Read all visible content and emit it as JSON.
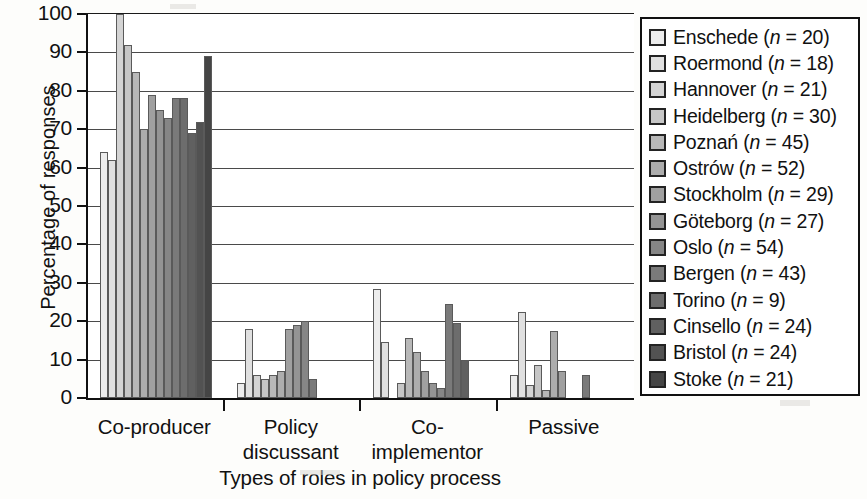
{
  "axis": {
    "ylabel": "Percentage of responses",
    "xlabel": "Types of roles in policy process",
    "yticks": [
      "0",
      "10",
      "20",
      "30",
      "40",
      "50",
      "60",
      "70",
      "80",
      "90",
      "100"
    ]
  },
  "legend": {
    "title": "",
    "items": [
      {
        "label": "Enschede (",
        "n_prefix": "n",
        "n_value": " = 20)",
        "color": "#ececec"
      },
      {
        "label": "Roermond (",
        "n_prefix": "n",
        "n_value": " = 18)",
        "color": "#e0e0e0"
      },
      {
        "label": "Hannover (",
        "n_prefix": "n",
        "n_value": " = 21)",
        "color": "#d4d4d4"
      },
      {
        "label": "Heidelberg (",
        "n_prefix": "n",
        "n_value": " = 30)",
        "color": "#c6c6c6"
      },
      {
        "label": "Poznań (",
        "n_prefix": "n",
        "n_value": " = 45)",
        "color": "#b8b8b8"
      },
      {
        "label": "Ostrów (",
        "n_prefix": "n",
        "n_value": " = 52)",
        "color": "#adadad"
      },
      {
        "label": "Stockholm (",
        "n_prefix": "n",
        "n_value": " = 29)",
        "color": "#a0a0a0"
      },
      {
        "label": "Göteborg (",
        "n_prefix": "n",
        "n_value": " = 27)",
        "color": "#949494"
      },
      {
        "label": "Oslo (",
        "n_prefix": "n",
        "n_value": " = 54)",
        "color": "#868686"
      },
      {
        "label": "Bergen (",
        "n_prefix": "n",
        "n_value": " = 43)",
        "color": "#7a7a7a"
      },
      {
        "label": "Torino (",
        "n_prefix": "n",
        "n_value": " = 9)",
        "color": "#6d6d6d"
      },
      {
        "label": "Cinsello (",
        "n_prefix": "n",
        "n_value": " = 24)",
        "color": "#606060"
      },
      {
        "label": "Bristol (",
        "n_prefix": "n",
        "n_value": " = 24)",
        "color": "#525252"
      },
      {
        "label": "Stoke (",
        "n_prefix": "n",
        "n_value": " = 21)",
        "color": "#454545"
      }
    ]
  },
  "chart_data": {
    "type": "bar",
    "title": "",
    "xlabel": "Types of roles in policy process",
    "ylabel": "Percentage of responses",
    "ylim": [
      0,
      100
    ],
    "ytick_step": 10,
    "grid": true,
    "legend_position": "right",
    "categories": [
      "Co-producer",
      "Policy discussant",
      "Co-implementor",
      "Passive"
    ],
    "category_lines": [
      [
        "Co-producer"
      ],
      [
        "Policy",
        "discussant"
      ],
      [
        "Co-implementor"
      ],
      [
        "Passive"
      ]
    ],
    "series": [
      {
        "name": "Enschede",
        "n": 20,
        "color": "#ececec",
        "values": [
          64,
          4,
          28.5,
          6
        ]
      },
      {
        "name": "Roermond",
        "n": 18,
        "color": "#e0e0e0",
        "values": [
          62,
          18,
          14.5,
          22.5
        ]
      },
      {
        "name": "Hannover",
        "n": 21,
        "color": "#d4d4d4",
        "values": [
          100,
          6,
          0,
          3.5
        ]
      },
      {
        "name": "Heidelberg",
        "n": 30,
        "color": "#c6c6c6",
        "values": [
          92,
          5,
          4,
          8.5
        ]
      },
      {
        "name": "Poznań",
        "n": 45,
        "color": "#b8b8b8",
        "values": [
          85,
          6,
          15.5,
          2
        ]
      },
      {
        "name": "Ostrów",
        "n": 52,
        "color": "#adadad",
        "values": [
          70,
          7,
          12,
          17.5
        ]
      },
      {
        "name": "Stockholm",
        "n": 29,
        "color": "#a0a0a0",
        "values": [
          79,
          18,
          7,
          7
        ]
      },
      {
        "name": "Göteborg",
        "n": 27,
        "color": "#949494",
        "values": [
          75,
          19,
          4,
          0
        ]
      },
      {
        "name": "Oslo",
        "n": 54,
        "color": "#868686",
        "values": [
          73,
          20,
          2.5,
          0
        ]
      },
      {
        "name": "Bergen",
        "n": 43,
        "color": "#7a7a7a",
        "values": [
          78,
          5,
          24.5,
          6
        ]
      },
      {
        "name": "Torino",
        "n": 9,
        "color": "#6d6d6d",
        "values": [
          78,
          0,
          19.5,
          0
        ]
      },
      {
        "name": "Cinsello",
        "n": 24,
        "color": "#606060",
        "values": [
          69,
          0,
          10,
          0
        ]
      },
      {
        "name": "Bristol",
        "n": 24,
        "color": "#525252",
        "values": [
          72,
          0,
          0,
          0
        ]
      },
      {
        "name": "Stoke",
        "n": 21,
        "color": "#454545",
        "values": [
          89,
          0,
          0,
          0
        ]
      }
    ]
  }
}
